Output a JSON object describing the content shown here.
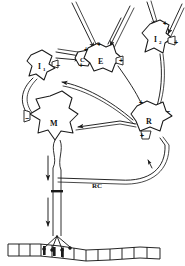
{
  "figure": {
    "background_color": "#ffffff",
    "ink_color": "#1a1a1a",
    "width": 185,
    "height": 266
  },
  "neurons": [
    {
      "id": "I1",
      "label": "I",
      "subscript": "1",
      "role": "inhibitory-interneuron-1",
      "x": 40,
      "y": 66
    },
    {
      "id": "E",
      "label": "E",
      "subscript": "",
      "role": "excitatory-interneuron",
      "x": 100,
      "y": 60
    },
    {
      "id": "C",
      "label": "C",
      "subscript": "",
      "role": "small-cell-c",
      "x": 83,
      "y": 60
    },
    {
      "id": "I2",
      "label": "I",
      "subscript": "2",
      "role": "inhibitory-interneuron-2",
      "x": 157,
      "y": 39
    },
    {
      "id": "R",
      "label": "R",
      "subscript": "",
      "role": "renshaw-cell",
      "x": 148,
      "y": 120
    },
    {
      "id": "M",
      "label": "M",
      "subscript": "",
      "role": "motoneuron",
      "x": 52,
      "y": 122
    }
  ],
  "annotations": [
    {
      "id": "RC",
      "text": "RC",
      "meaning": "recurrent-collateral",
      "x": 99,
      "y": 184
    }
  ],
  "synapse_signs": [
    {
      "id": "s-E-in-left",
      "sign": "+",
      "x": 86,
      "y": 52
    },
    {
      "id": "s-E-in-lower",
      "sign": "+",
      "x": 81,
      "y": 67
    },
    {
      "id": "s-E-in-top",
      "sign": "+",
      "x": 99,
      "y": 47
    },
    {
      "id": "s-E-out-right",
      "sign": "+",
      "x": 119,
      "y": 63
    },
    {
      "id": "s-I2-top",
      "sign": "+",
      "x": 162,
      "y": 25
    },
    {
      "id": "s-I2-right",
      "sign": "+",
      "x": 172,
      "y": 44
    },
    {
      "id": "s-R-topleft",
      "sign": "+",
      "x": 140,
      "y": 104
    },
    {
      "id": "s-R-topright",
      "sign": "−",
      "x": 166,
      "y": 112
    },
    {
      "id": "s-R-bottom",
      "sign": "+",
      "x": 145,
      "y": 136
    },
    {
      "id": "s-I1-right",
      "sign": "−",
      "x": 56,
      "y": 66
    },
    {
      "id": "s-M-left",
      "sign": "−",
      "x": 31,
      "y": 119
    }
  ],
  "pathways": [
    {
      "id": "afferent-to-E",
      "from": "descending-fiber",
      "to": "E",
      "effect": "excitatory"
    },
    {
      "id": "afferent-to-C",
      "from": "afferent-fiber",
      "to": "C",
      "effect": "excitatory"
    },
    {
      "id": "afferent-to-I2",
      "from": "descending-fiber",
      "to": "I2",
      "effect": "excitatory"
    },
    {
      "id": "E-to-R",
      "from": "E",
      "to": "R",
      "effect": "excitatory"
    },
    {
      "id": "I2-to-R",
      "from": "I2",
      "to": "R",
      "effect": "inhibitory"
    },
    {
      "id": "R-to-M",
      "from": "R",
      "to": "M",
      "effect": "inhibitory"
    },
    {
      "id": "R-to-I1",
      "from": "R",
      "to": "I1",
      "effect": "inhibitory"
    },
    {
      "id": "I1-to-M",
      "from": "I1",
      "to": "M",
      "effect": "inhibitory"
    },
    {
      "id": "M-axon-to-muscle",
      "from": "M",
      "to": "muscle",
      "effect": "excitatory"
    },
    {
      "id": "RC-to-R",
      "from": "M-axon-collateral",
      "to": "R",
      "effect": "excitatory"
    }
  ],
  "muscle": {
    "id": "muscle-fiber",
    "name": "striated-muscle-fiber",
    "striations": 12
  }
}
